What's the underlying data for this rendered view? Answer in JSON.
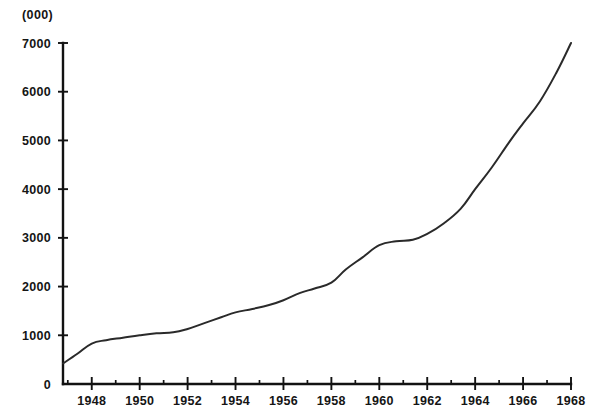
{
  "chart_data": {
    "type": "line",
    "title": "",
    "subtitle": "",
    "xlabel": "",
    "ylabel": "",
    "unit_note": "(000)",
    "grid": false,
    "legend": false,
    "xlim": [
      1946.8,
      1968
    ],
    "ylim": [
      0,
      7000
    ],
    "y_ticks": [
      0,
      1000,
      2000,
      3000,
      4000,
      5000,
      6000,
      7000
    ],
    "y_tick_labels": [
      "0",
      "1000",
      "2000",
      "3000",
      "4000",
      "5000",
      "6000",
      "7000"
    ],
    "x_ticks_major": [
      1948,
      1950,
      1952,
      1954,
      1956,
      1958,
      1960,
      1962,
      1964,
      1966,
      1968
    ],
    "x_tick_labels": [
      "1948",
      "1950",
      "1952",
      "1954",
      "1956",
      "1958",
      "1960",
      "1962",
      "1964",
      "1966",
      "1968"
    ],
    "x_ticks_minor": [
      1947,
      1949,
      1951,
      1953,
      1955,
      1957,
      1959,
      1961,
      1963,
      1965,
      1967
    ],
    "series": [
      {
        "name": "series-1",
        "color": "#2a2a2a",
        "x": [
          1946.8,
          1947.4,
          1948.0,
          1948.6,
          1949.3,
          1950.0,
          1950.7,
          1951.4,
          1952.0,
          1952.7,
          1953.4,
          1954.0,
          1954.7,
          1955.4,
          1956.0,
          1956.7,
          1957.3,
          1958.0,
          1958.6,
          1959.3,
          1960.0,
          1960.7,
          1961.4,
          1962.0,
          1962.7,
          1963.4,
          1964.0,
          1964.7,
          1965.4,
          1966.0,
          1966.7,
          1967.4,
          1968.0
        ],
        "y": [
          420,
          620,
          830,
          900,
          950,
          1000,
          1040,
          1060,
          1130,
          1250,
          1370,
          1470,
          1540,
          1620,
          1720,
          1870,
          1960,
          2080,
          2350,
          2600,
          2850,
          2930,
          2960,
          3080,
          3300,
          3600,
          4000,
          4450,
          4950,
          5350,
          5800,
          6400,
          7000
        ]
      }
    ]
  },
  "geometry": {
    "plot_left_px": 63,
    "plot_right_px": 571,
    "plot_top_px": 43,
    "plot_bottom_px": 384
  }
}
